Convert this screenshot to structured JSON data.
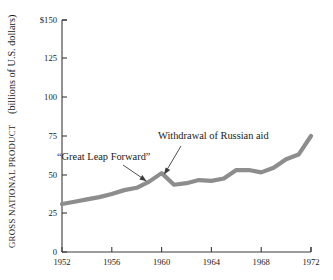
{
  "chart_data": {
    "type": "line",
    "title": "",
    "subtitle": "",
    "xlabel": "",
    "ylabel_smallcaps": "GROSS NATIONAL PRODUCT",
    "ylabel_normal": "(billions of U.S. dollars)",
    "ylabel_full": "GROSS NATIONAL PRODUCT (billions of U.S. dollars)",
    "x": [
      1952,
      1953,
      1954,
      1955,
      1956,
      1957,
      1958,
      1959,
      1960,
      1961,
      1962,
      1963,
      1964,
      1965,
      1966,
      1967,
      1968,
      1969,
      1970,
      1971,
      1972
    ],
    "values": [
      31,
      32.5,
      34,
      35.5,
      37.5,
      40,
      41.5,
      45.5,
      51,
      43.5,
      44.5,
      46.5,
      46,
      47.5,
      53,
      53,
      51.5,
      54.5,
      60,
      63,
      75
    ],
    "series": [
      {
        "name": "Gross National Product",
        "values": [
          31,
          32.5,
          34,
          35.5,
          37.5,
          40,
          41.5,
          45.5,
          51,
          43.5,
          44.5,
          46.5,
          46,
          47.5,
          53,
          53,
          51.5,
          54.5,
          60,
          63,
          75
        ]
      }
    ],
    "xlim": [
      1952,
      1972
    ],
    "ylim": [
      0,
      150
    ],
    "xticks": [
      1952,
      1956,
      1960,
      1964,
      1968,
      1972
    ],
    "xtick_labels": [
      "1952",
      "1956",
      "1960",
      "1964",
      "1968",
      "1972"
    ],
    "yticks": [
      0,
      25,
      50,
      75,
      100,
      125,
      150
    ],
    "ytick_labels": [
      "0",
      "25",
      "50",
      "75",
      "100",
      "125",
      "$150"
    ],
    "grid": false,
    "legend": null,
    "line_color": "#8d8d8d",
    "axis_color": "#3a3a3a",
    "background_color": "#ffffff",
    "annotations": [
      {
        "id": "great-leap-forward",
        "text": "“Great Leap Forward”",
        "points_to_year": 1959,
        "points_to_value": 47
      },
      {
        "id": "withdrawal-russian-aid",
        "text": "Withdrawal of Russian aid",
        "points_to_year": 1960,
        "points_to_value": 51
      }
    ]
  }
}
